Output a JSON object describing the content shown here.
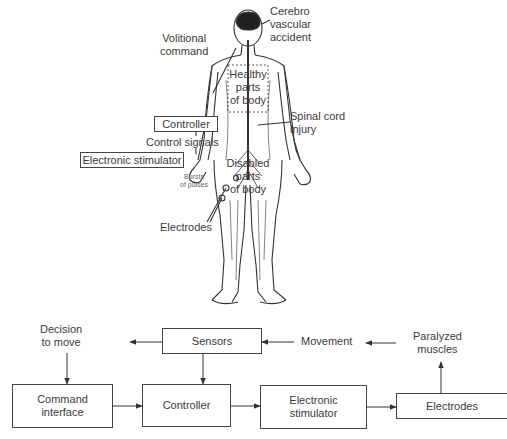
{
  "figure": {
    "upper": {
      "labels": {
        "cva": "Cerebro\nvascular\naccident",
        "volitional": "Volitional\ncommand",
        "healthy": "Healthy\nparts\nof body",
        "spinal": "Spinal cord\ninjury",
        "disabled": "Disabled\nparts\nof body",
        "control_signals": "Control signals",
        "bursts": "Bursts\nof pulses",
        "electrodes": "Electrodes"
      },
      "boxes": {
        "controller": "Controller",
        "stimulator": "Electronic stimulator"
      }
    },
    "lower": {
      "labels": {
        "decision": "Decision\nto move",
        "movement": "Movement",
        "paralyzed": "Paralyzed\nmuscles"
      },
      "boxes": {
        "sensors": "Sensors",
        "command_interface": "Command\ninterface",
        "controller": "Controller",
        "stimulator": "Electronic\nstimulator",
        "electrodes": "Electrodes"
      }
    },
    "colors": {
      "line": "#444444",
      "text": "#3a3a3a",
      "background": "#ffffff"
    }
  }
}
